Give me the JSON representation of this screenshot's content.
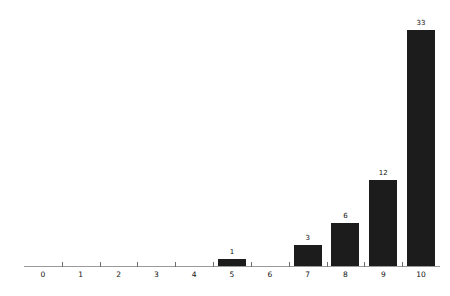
{
  "chart_data": {
    "type": "bar",
    "title": "",
    "subtitle": "",
    "xlabel": "",
    "ylabel": "",
    "categories": [
      "0",
      "1",
      "2",
      "3",
      "4",
      "5",
      "6",
      "7",
      "8",
      "9",
      "10"
    ],
    "values": [
      0,
      0,
      0,
      0,
      0,
      1,
      0,
      3,
      6,
      12,
      33
    ],
    "value_labels": [
      "",
      "",
      "",
      "",
      "",
      "1",
      "",
      "3",
      "6",
      "12",
      "33"
    ],
    "xlim": [
      -0.5,
      10.5
    ],
    "ylim": [
      0,
      33
    ],
    "grid": false,
    "legend": false,
    "legend_position": "none",
    "minor_ticks_between_categories": true,
    "bar_color": "#1c1c1c",
    "axis_color": "#9a9a9a",
    "tick_color": "#6e6e6e",
    "label_color": "#111111",
    "background_color": "#ffffff"
  }
}
